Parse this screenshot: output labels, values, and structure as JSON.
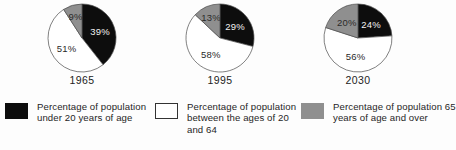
{
  "chart_data": {
    "type": "pie",
    "title": "",
    "charts": [
      {
        "label": "1965",
        "categories": [
          "Percentage of population under 20 years of age",
          "Percentage of population between the ages of 20 and 64",
          "Percentage of population 65 years of age and over"
        ],
        "values": [
          39,
          51,
          9
        ],
        "value_labels": [
          "39%",
          "51%",
          "9%"
        ],
        "colors": [
          "#0d0d0d",
          "#ffffff",
          "#8f8f8f"
        ]
      },
      {
        "label": "1995",
        "categories": [
          "Percentage of population under 20 years of age",
          "Percentage of population between the ages of 20 and 64",
          "Percentage of population 65 years of age and over"
        ],
        "values": [
          29,
          58,
          13
        ],
        "value_labels": [
          "29%",
          "58%",
          "13%"
        ],
        "colors": [
          "#0d0d0d",
          "#ffffff",
          "#8f8f8f"
        ]
      },
      {
        "label": "2030",
        "categories": [
          "Percentage of population under 20 years of age",
          "Percentage of population between the ages of 20 and 64",
          "Percentage of population 65 years of age and over"
        ],
        "values": [
          24,
          56,
          20
        ],
        "value_labels": [
          "24%",
          "56%",
          "20%"
        ],
        "colors": [
          "#0d0d0d",
          "#ffffff",
          "#8f8f8f"
        ]
      }
    ],
    "legend": {
      "position": "bottom",
      "entries": [
        {
          "swatch_color": "#0d0d0d",
          "swatch_style": "black",
          "label": "Percentage of population under 20 years of age"
        },
        {
          "swatch_color": "#ffffff",
          "swatch_style": "white",
          "label": "Percentage of population between the ages of 20 and 64"
        },
        {
          "swatch_color": "#8f8f8f",
          "swatch_style": "gray",
          "label": "Percentage of population 65 years of age and over"
        }
      ]
    },
    "start_angle_deg": 0,
    "direction": "clockwise",
    "grid": false
  }
}
